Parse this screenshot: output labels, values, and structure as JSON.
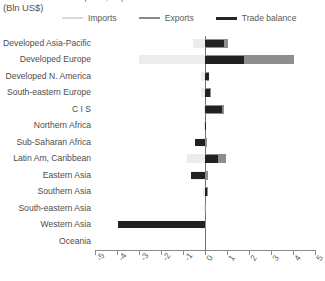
{
  "header": {
    "cut_title": "Imports, exports and trade balance",
    "units_label": "(Bln US$)"
  },
  "legend": {
    "position": "top",
    "items": [
      {
        "label": "Imports",
        "color": "#ececec",
        "icon": "line-swatch-icon"
      },
      {
        "label": "Exports",
        "color": "#8e8e8e",
        "icon": "line-swatch-icon"
      },
      {
        "label": "Trade balance",
        "color": "#212121",
        "icon": "line-swatch-icon"
      }
    ]
  },
  "chart_data": {
    "type": "bar",
    "orientation": "horizontal",
    "title": "Imports, exports and trade balance",
    "xlabel": "(Bln US$)",
    "ylabel": "",
    "xlim": [
      -5,
      5
    ],
    "xticks": [
      -5,
      -4,
      -3,
      -2,
      -1,
      0,
      1,
      2,
      3,
      4,
      5
    ],
    "xtick_labels": [
      "-5",
      "-4",
      "-3",
      "-2",
      "-1",
      "0",
      "1",
      "2",
      "3",
      "4",
      "5"
    ],
    "grid": false,
    "zero_line": 0,
    "categories": [
      "Developed Asia-Pacific",
      "Developed Europe",
      "Developed N. America",
      "South-eastern Europe",
      "C I S",
      "Northern Africa",
      "Sub-Saharan Africa",
      "Latin Am, Caribbean",
      "Eastern Asia",
      "Southern Asia",
      "South-eastern Asia",
      "Western Asia",
      "Oceania"
    ],
    "series": [
      {
        "name": "Imports",
        "color": "#ececec",
        "values": [
          -0.55,
          -3.0,
          -0.2,
          -0.2,
          -0.05,
          -0.05,
          -0.25,
          -0.8,
          -0.6,
          -0.1,
          -0.05,
          -0.2,
          0.0
        ]
      },
      {
        "name": "Exports",
        "color": "#8e8e8e",
        "values": [
          1.05,
          4.05,
          0.2,
          0.25,
          0.85,
          0.05,
          0.1,
          0.95,
          0.15,
          0.12,
          0.05,
          0.05,
          0.0
        ]
      },
      {
        "name": "Trade balance",
        "color": "#212121",
        "values": [
          0.85,
          1.75,
          0.18,
          0.22,
          0.75,
          0.05,
          -0.45,
          0.6,
          -0.65,
          0.08,
          0.0,
          -3.95,
          0.0
        ]
      }
    ]
  }
}
